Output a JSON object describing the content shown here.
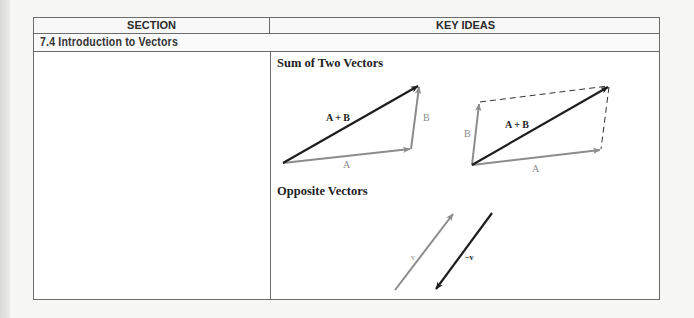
{
  "table": {
    "headers": {
      "section": "SECTION",
      "key_ideas": "KEY IDEAS"
    },
    "section_title": "7.4 Introduction to Vectors",
    "key_ideas": [
      {
        "heading": "Sum of Two Vectors",
        "figures": [
          {
            "type": "triangle-rule",
            "labels": {
              "sum": "A + B",
              "a": "A",
              "b": "B"
            }
          },
          {
            "type": "parallelogram-rule",
            "labels": {
              "sum": "A + B",
              "a": "A",
              "b": "B"
            }
          }
        ]
      },
      {
        "heading": "Opposite Vectors",
        "figures": [
          {
            "type": "opposite",
            "labels": {
              "v": "v",
              "neg_v": "−v"
            }
          }
        ]
      }
    ]
  },
  "colors": {
    "dark_vector": "#1e1e1e",
    "gray_vector": "#8c8c8c",
    "border": "#6b6b6b"
  }
}
